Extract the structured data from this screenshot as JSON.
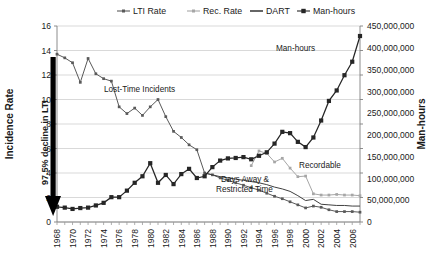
{
  "chart_data": {
    "type": "line",
    "title": "",
    "xlabel": "",
    "ylabel": "Incidence Rate",
    "y2label": "Man-hours",
    "ylim": [
      0,
      16
    ],
    "y2lim": [
      0,
      450000000
    ],
    "xlim": [
      1968,
      2007
    ],
    "grid": true,
    "legend_position": "top",
    "y_ticks": [
      "0",
      "2",
      "4",
      "6",
      "8",
      "10",
      "12",
      "14",
      "16"
    ],
    "y2_ticks": [
      "0",
      "50,000,000",
      "100,000,000",
      "150,000,000",
      "200,000,000",
      "250,000,000",
      "300,000,000",
      "350,000,000",
      "400,000,000",
      "450,000,000"
    ],
    "x_ticks": [
      "1968",
      "1970",
      "1972",
      "1974",
      "1976",
      "1978",
      "1980",
      "1982",
      "1984",
      "1986",
      "1988",
      "1990",
      "1992",
      "1994",
      "1996",
      "1998",
      "2000",
      "2002",
      "2004",
      "2006"
    ],
    "x": [
      1968,
      1969,
      1970,
      1971,
      1972,
      1973,
      1974,
      1975,
      1976,
      1977,
      1978,
      1979,
      1980,
      1981,
      1982,
      1983,
      1984,
      1985,
      1986,
      1987,
      1988,
      1989,
      1990,
      1991,
      1992,
      1993,
      1994,
      1995,
      1996,
      1997,
      1998,
      1999,
      2000,
      2001,
      2002,
      2003,
      2004,
      2005,
      2006,
      2007
    ],
    "series": [
      {
        "name": "LTI Rate",
        "axis": "left",
        "color": "#595959",
        "marker": "small-square",
        "values": [
          13.7,
          13.4,
          13.0,
          11.4,
          13.35,
          12.1,
          11.7,
          11.5,
          9.4,
          8.85,
          9.3,
          8.7,
          9.4,
          10.0,
          8.6,
          7.4,
          6.9,
          6.3,
          5.9,
          4.0,
          3.85,
          3.6,
          3.4,
          3.2,
          3.0,
          2.8,
          2.6,
          2.35,
          2.1,
          1.9,
          1.65,
          1.4,
          1.15,
          1.3,
          1.2,
          1.0,
          0.85,
          0.85,
          0.85,
          0.8
        ]
      },
      {
        "name": "Rec. Rate",
        "axis": "left",
        "color": "#a6a6a6",
        "marker": "small-square",
        "values": [
          null,
          null,
          null,
          null,
          null,
          null,
          null,
          null,
          null,
          null,
          null,
          null,
          null,
          null,
          null,
          null,
          null,
          null,
          null,
          null,
          null,
          null,
          null,
          null,
          null,
          4.6,
          5.8,
          5.6,
          4.9,
          5.2,
          4.4,
          3.7,
          3.75,
          2.3,
          2.2,
          2.2,
          2.25,
          2.2,
          2.2,
          2.15
        ]
      },
      {
        "name": "DART",
        "axis": "left",
        "color": "#404040",
        "marker": "none",
        "values": [
          null,
          null,
          null,
          null,
          null,
          null,
          null,
          null,
          null,
          null,
          null,
          null,
          null,
          null,
          null,
          null,
          null,
          null,
          null,
          4.0,
          3.85,
          3.7,
          3.6,
          3.5,
          3.4,
          3.3,
          3.2,
          3.05,
          2.85,
          2.7,
          2.5,
          2.15,
          1.75,
          1.85,
          1.45,
          1.4,
          1.35,
          1.35,
          1.3,
          1.3
        ]
      },
      {
        "name": "Man-hours",
        "axis": "right",
        "color": "#262626",
        "marker": "square",
        "values": [
          35000000,
          33000000,
          30000000,
          32000000,
          33000000,
          38000000,
          44000000,
          57000000,
          57000000,
          72000000,
          90000000,
          105000000,
          135000000,
          90000000,
          108000000,
          87000000,
          110000000,
          122000000,
          101000000,
          105000000,
          126000000,
          141000000,
          146000000,
          147000000,
          149000000,
          144000000,
          152000000,
          160000000,
          180000000,
          207000000,
          204000000,
          184000000,
          172000000,
          194000000,
          233000000,
          278000000,
          302000000,
          337000000,
          368000000,
          427000000
        ]
      }
    ],
    "annotations": [
      {
        "name": "lost-time-incidents",
        "text": "Lost-Time Incidents"
      },
      {
        "name": "man-hours",
        "text": "Man-hours"
      },
      {
        "name": "recordable",
        "text": "Recordable"
      },
      {
        "name": "days-away-line1",
        "text": "Days Away &"
      },
      {
        "name": "days-away-line2",
        "text": "Restricted Time"
      },
      {
        "name": "decline-arrow-label",
        "text": "97.5% decline in LTI"
      }
    ]
  },
  "legend": {
    "items": [
      {
        "label": "LTI Rate",
        "color": "#595959"
      },
      {
        "label": "Rec. Rate",
        "color": "#a6a6a6"
      },
      {
        "label": "DART",
        "color": "#404040"
      },
      {
        "label": "Man-hours",
        "color": "#262626"
      }
    ]
  },
  "axes": {
    "left_title": "Incidence Rate",
    "right_title": "Man-hours"
  }
}
